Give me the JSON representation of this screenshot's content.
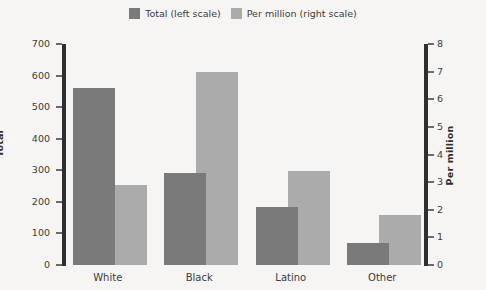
{
  "legend": {
    "items": [
      {
        "label": "Total (left scale)",
        "color": "#7a7a7a",
        "swatch_name": "legend-swatch-total"
      },
      {
        "label": "Per million (right scale)",
        "color": "#ababab",
        "swatch_name": "legend-swatch-per-million"
      }
    ]
  },
  "axes": {
    "left": {
      "title": "Total",
      "ticks": [
        "0",
        "100",
        "200",
        "300",
        "400",
        "500",
        "600",
        "700"
      ]
    },
    "right": {
      "title": "Per million",
      "ticks": [
        "0",
        "1",
        "2",
        "3",
        "4",
        "5",
        "6",
        "7",
        "8"
      ]
    }
  },
  "chart_data": {
    "type": "bar",
    "title": "",
    "xlabel": "",
    "ylabel": "Total",
    "y2label": "Per million",
    "categories": [
      "White",
      "Black",
      "Latino",
      "Other"
    ],
    "series": [
      {
        "name": "Total (left scale)",
        "axis": "left",
        "color": "#7a7a7a",
        "values": [
          560,
          290,
          185,
          70
        ]
      },
      {
        "name": "Per million (right scale)",
        "axis": "right",
        "color": "#ababab",
        "values": [
          2.9,
          7.0,
          3.4,
          1.8
        ]
      }
    ],
    "ylim": [
      0,
      700
    ],
    "ytick_step": 100,
    "y2lim": [
      0,
      8
    ],
    "y2tick_step": 1,
    "grid": false,
    "legend_position": "top-center",
    "background": "#f7f5f3"
  }
}
